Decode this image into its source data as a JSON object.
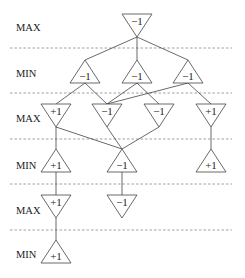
{
  "diagram": {
    "title": "",
    "levels": [
      {
        "label": "MAX",
        "y": 27
      },
      {
        "label": "MIN",
        "y": 73
      },
      {
        "label": "MAX",
        "y": 118
      },
      {
        "label": "MIN",
        "y": 165
      },
      {
        "label": "MAX",
        "y": 210
      },
      {
        "label": "MIN",
        "y": 254
      }
    ],
    "separators_y": [
      48,
      93,
      139,
      184,
      230
    ],
    "nodes": [
      {
        "id": "n0",
        "type": "max",
        "value": "−1",
        "x": 137,
        "y": 14
      },
      {
        "id": "n1",
        "type": "min",
        "value": "−1",
        "x": 85,
        "y": 60
      },
      {
        "id": "n2",
        "type": "min",
        "value": "−1",
        "x": 137,
        "y": 60
      },
      {
        "id": "n3",
        "type": "min",
        "value": "−1",
        "x": 188,
        "y": 60
      },
      {
        "id": "n4",
        "type": "max",
        "value": "+1",
        "x": 56,
        "y": 104
      },
      {
        "id": "n5",
        "type": "max",
        "value": "−1",
        "x": 107,
        "y": 104
      },
      {
        "id": "n6",
        "type": "max",
        "value": "−1",
        "x": 159,
        "y": 104
      },
      {
        "id": "n7",
        "type": "max",
        "value": "+1",
        "x": 211,
        "y": 104
      },
      {
        "id": "n8",
        "type": "min",
        "value": "+1",
        "x": 56,
        "y": 149
      },
      {
        "id": "n9",
        "type": "min",
        "value": "−1",
        "x": 122,
        "y": 149
      },
      {
        "id": "n10",
        "type": "min",
        "value": "+1",
        "x": 211,
        "y": 149
      },
      {
        "id": "n11",
        "type": "max",
        "value": "+1",
        "x": 56,
        "y": 195
      },
      {
        "id": "n12",
        "type": "max",
        "value": "−1",
        "x": 122,
        "y": 195
      },
      {
        "id": "n13",
        "type": "min",
        "value": "+1",
        "x": 56,
        "y": 240
      }
    ],
    "edges": [
      [
        "n0",
        "n1"
      ],
      [
        "n0",
        "n2"
      ],
      [
        "n0",
        "n3"
      ],
      [
        "n1",
        "n4"
      ],
      [
        "n1",
        "n5"
      ],
      [
        "n2",
        "n5"
      ],
      [
        "n2",
        "n6"
      ],
      [
        "n3",
        "n5"
      ],
      [
        "n3",
        "n7"
      ],
      [
        "n4",
        "n8"
      ],
      [
        "n4",
        "n9"
      ],
      [
        "n5",
        "n9"
      ],
      [
        "n6",
        "n9"
      ],
      [
        "n7",
        "n10"
      ],
      [
        "n8",
        "n11"
      ],
      [
        "n9",
        "n12"
      ],
      [
        "n11",
        "n13"
      ]
    ]
  }
}
